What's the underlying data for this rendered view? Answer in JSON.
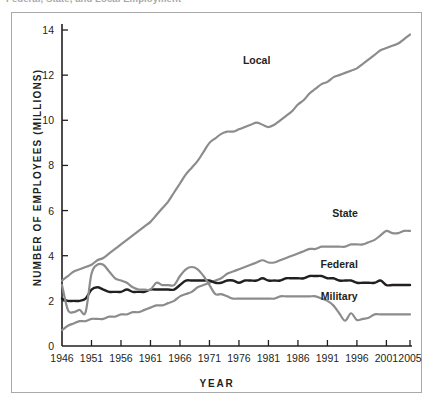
{
  "caption": "Federal, State, and Local Employment",
  "chart_data": {
    "type": "line",
    "title": "",
    "xlabel": "YEAR",
    "ylabel": "NUMBER OF EMPLOYEES (MILLIONS)",
    "xlim": [
      1946,
      2005
    ],
    "ylim": [
      0,
      14
    ],
    "grid": false,
    "legend_position": "inline-labels",
    "xticks": [
      "1946",
      "1951",
      "1956",
      "1961",
      "1966",
      "1971",
      "1976",
      "1981",
      "1986",
      "1991",
      "1996",
      "2001",
      "2005"
    ],
    "xtick_values": [
      1946,
      1951,
      1956,
      1961,
      1966,
      1971,
      1976,
      1981,
      1986,
      1991,
      1996,
      2001,
      2005
    ],
    "yticks": [
      "0",
      "2",
      "4",
      "6",
      "8",
      "10",
      "12",
      "14"
    ],
    "ytick_values": [
      0,
      2,
      4,
      6,
      8,
      10,
      12,
      14
    ],
    "x": [
      1946,
      1947,
      1948,
      1949,
      1950,
      1951,
      1952,
      1953,
      1954,
      1955,
      1956,
      1957,
      1958,
      1959,
      1960,
      1961,
      1962,
      1963,
      1964,
      1965,
      1966,
      1967,
      1968,
      1969,
      1970,
      1971,
      1972,
      1973,
      1974,
      1975,
      1976,
      1977,
      1978,
      1979,
      1980,
      1981,
      1982,
      1983,
      1984,
      1985,
      1986,
      1987,
      1988,
      1989,
      1990,
      1991,
      1992,
      1993,
      1994,
      1995,
      1996,
      1997,
      1998,
      1999,
      2000,
      2001,
      2002,
      2003,
      2004,
      2005
    ],
    "series": [
      {
        "name": "Local",
        "color": "#8c8c8c",
        "label_x": 1979,
        "label_y": 12.5,
        "values": [
          2.9,
          3.1,
          3.3,
          3.4,
          3.5,
          3.6,
          3.8,
          3.9,
          4.1,
          4.3,
          4.5,
          4.7,
          4.9,
          5.1,
          5.3,
          5.5,
          5.8,
          6.1,
          6.4,
          6.8,
          7.2,
          7.6,
          7.9,
          8.2,
          8.6,
          9.0,
          9.2,
          9.4,
          9.5,
          9.5,
          9.6,
          9.7,
          9.8,
          9.9,
          9.8,
          9.7,
          9.8,
          10.0,
          10.2,
          10.4,
          10.7,
          10.9,
          11.2,
          11.4,
          11.6,
          11.7,
          11.9,
          12.0,
          12.1,
          12.2,
          12.3,
          12.5,
          12.7,
          12.9,
          13.1,
          13.2,
          13.3,
          13.4,
          13.6,
          13.8
        ]
      },
      {
        "name": "State",
        "color": "#8c8c8c",
        "label_x": 1994,
        "label_y": 5.7,
        "values": [
          0.7,
          0.9,
          1.0,
          1.1,
          1.1,
          1.2,
          1.2,
          1.2,
          1.3,
          1.3,
          1.4,
          1.4,
          1.5,
          1.5,
          1.6,
          1.7,
          1.8,
          1.8,
          1.9,
          2.0,
          2.2,
          2.3,
          2.4,
          2.6,
          2.7,
          2.8,
          2.9,
          3.0,
          3.2,
          3.3,
          3.4,
          3.5,
          3.6,
          3.7,
          3.8,
          3.7,
          3.7,
          3.8,
          3.9,
          4.0,
          4.1,
          4.2,
          4.3,
          4.3,
          4.4,
          4.4,
          4.4,
          4.4,
          4.4,
          4.5,
          4.5,
          4.5,
          4.6,
          4.7,
          4.9,
          5.1,
          5.0,
          5.0,
          5.1,
          5.1
        ]
      },
      {
        "name": "Federal",
        "color": "#231f20",
        "label_x": 1993,
        "label_y": 3.45,
        "values": [
          2.1,
          2.0,
          2.0,
          2.0,
          2.1,
          2.5,
          2.6,
          2.5,
          2.4,
          2.4,
          2.4,
          2.5,
          2.4,
          2.4,
          2.4,
          2.5,
          2.5,
          2.5,
          2.5,
          2.5,
          2.7,
          2.9,
          2.9,
          2.9,
          2.9,
          2.9,
          2.8,
          2.8,
          2.9,
          2.9,
          2.8,
          2.9,
          2.9,
          2.9,
          3.0,
          2.9,
          2.9,
          2.9,
          3.0,
          3.0,
          3.0,
          3.0,
          3.1,
          3.1,
          3.1,
          3.0,
          3.0,
          2.9,
          2.9,
          2.9,
          2.8,
          2.8,
          2.8,
          2.8,
          2.9,
          2.7,
          2.7,
          2.7,
          2.7,
          2.7
        ]
      },
      {
        "name": "Military",
        "color": "#8c8c8c",
        "label_x": 1993,
        "label_y": 2.05,
        "values": [
          2.7,
          1.6,
          1.5,
          1.6,
          1.5,
          3.2,
          3.6,
          3.6,
          3.3,
          3.0,
          2.9,
          2.8,
          2.6,
          2.5,
          2.5,
          2.5,
          2.8,
          2.7,
          2.7,
          2.7,
          3.1,
          3.4,
          3.5,
          3.4,
          3.1,
          2.7,
          2.3,
          2.3,
          2.2,
          2.1,
          2.1,
          2.1,
          2.1,
          2.1,
          2.1,
          2.1,
          2.1,
          2.2,
          2.2,
          2.2,
          2.2,
          2.2,
          2.2,
          2.2,
          2.1,
          2.0,
          1.8,
          1.7,
          1.6,
          1.5,
          1.4,
          1.4,
          1.4,
          1.4,
          1.4,
          1.4,
          1.4,
          1.4,
          1.4,
          1.4
        ],
        "dip_note": "sharp dip to 1.1 in 1994 with small spike 1995"
      }
    ],
    "colors": {
      "axis": "#231f20",
      "frame": "#a9a9a9",
      "dark_series": "#231f20",
      "gray_series": "#8c8c8c",
      "background": "#ffffff"
    }
  }
}
